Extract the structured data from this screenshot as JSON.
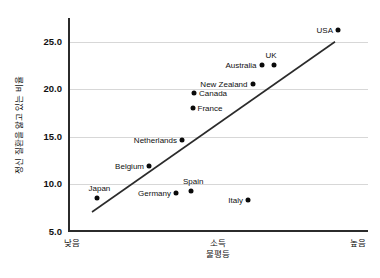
{
  "chart_data": {
    "type": "scatter",
    "title": "",
    "xlabel": "소득\n불평등",
    "ylabel": "정신 질환을 앓고 있는 비율",
    "xlim": [
      0,
      100
    ],
    "ylim": [
      5.0,
      27.5
    ],
    "grid": true,
    "legend": "none",
    "y_ticks": [
      "25.0",
      "20.0",
      "15.0",
      "10.0",
      "5.0"
    ],
    "y_tick_values": [
      25.0,
      20.0,
      15.0,
      10.0,
      5.0
    ],
    "x_tick_labels": [
      "낮음",
      "높음"
    ],
    "x_axis_caption_line1": "소득",
    "x_axis_caption_line2": "불평등",
    "points": [
      {
        "label": "USA",
        "x": 90.0,
        "y": 26.2,
        "label_side": "left"
      },
      {
        "label": "UK",
        "x": 68.5,
        "y": 22.6,
        "label_side": "above"
      },
      {
        "label": "Australia",
        "x": 64.5,
        "y": 22.6,
        "label_side": "left"
      },
      {
        "label": "New Zealand",
        "x": 61.5,
        "y": 20.6,
        "label_side": "left"
      },
      {
        "label": "Canada",
        "x": 42.0,
        "y": 19.6,
        "label_side": "right"
      },
      {
        "label": "France",
        "x": 41.5,
        "y": 18.0,
        "label_side": "right"
      },
      {
        "label": "Netherlands",
        "x": 38.0,
        "y": 14.7,
        "label_side": "left"
      },
      {
        "label": "Belgium",
        "x": 27.0,
        "y": 11.9,
        "label_side": "left"
      },
      {
        "label": "Spain",
        "x": 41.0,
        "y": 9.3,
        "label_side": "above"
      },
      {
        "label": "Germany",
        "x": 36.0,
        "y": 9.1,
        "label_side": "left"
      },
      {
        "label": "Japan",
        "x": 9.5,
        "y": 8.6,
        "label_side": "above"
      },
      {
        "label": "Italy",
        "x": 60.0,
        "y": 8.4,
        "label_side": "left"
      }
    ],
    "trendline": {
      "x_start": 8.0,
      "y_start": 7.1,
      "x_end": 89.0,
      "y_end": 25.0,
      "color": "#2b2b2b"
    }
  },
  "colors": {
    "point": "#0a0a0a",
    "axis": "#2b2b2b",
    "grid": "#d7d7d7",
    "background": "#ffffff",
    "text": "#111111"
  }
}
